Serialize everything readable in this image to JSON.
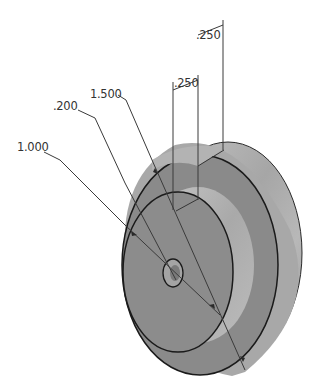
{
  "drawing": {
    "type": "isometric-part-drawing",
    "part": "stepped-disc-with-center-hole",
    "colors": {
      "background": "#ffffff",
      "front_face": "#8a8a8a",
      "recess_face": "#7e7e7e",
      "inner_cylinder": "#b4b4b4",
      "outer_rim_light": "#bdbdbd",
      "outer_rim_mid": "#9c9c9c",
      "edge_line": "#1a1a1a",
      "dimension_text": "#333333"
    },
    "dimensions": [
      {
        "id": "dim-1000",
        "label": "1.000",
        "meaning": "inner boss diameter"
      },
      {
        "id": "dim-200",
        "label": ".200",
        "meaning": "center hole diameter"
      },
      {
        "id": "dim-1500",
        "label": "1.500",
        "meaning": "outer diameter"
      },
      {
        "id": "dim-250-a",
        "label": ".250",
        "meaning": "recess depth"
      },
      {
        "id": "dim-250-b",
        "label": ".250",
        "meaning": "rim thickness"
      }
    ]
  }
}
